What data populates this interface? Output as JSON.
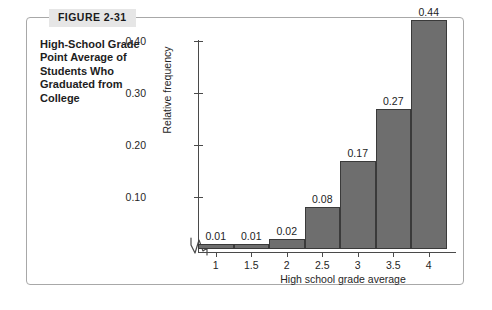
{
  "figure": {
    "badge_label": "FIGURE 2-31",
    "caption": "High-School Grade Point Average of Students Who Graduated from College"
  },
  "chart_data": {
    "type": "bar",
    "title": "High-School Grade Point Average of Students Who Graduated from College",
    "xlabel": "High school grade average",
    "ylabel": "Relative frequency",
    "categories": [
      "1",
      "1.5",
      "2",
      "2.5",
      "3",
      "3.5",
      "4"
    ],
    "values": [
      0.01,
      0.01,
      0.02,
      0.08,
      0.17,
      0.27,
      0.44
    ],
    "value_labels": [
      "0.01",
      "0.01",
      "0.02",
      "0.08",
      "0.17",
      "0.27",
      "0.44"
    ],
    "ytick_labels": [
      "0.10",
      "0.20",
      "0.30",
      "0.40"
    ],
    "ytick_values": [
      0.1,
      0.2,
      0.3,
      0.4
    ],
    "ylim": [
      0,
      0.48
    ],
    "grid": false,
    "legend": false,
    "axis_break": "y-axis-break-zigzag",
    "bar_fill_color": "#6e6e6e",
    "bar_edge_color": "#3a3a3a",
    "axis_color": "#4a4a4a",
    "frame_color": "#a8a8a8",
    "badge_color": "#e6e6e6"
  }
}
